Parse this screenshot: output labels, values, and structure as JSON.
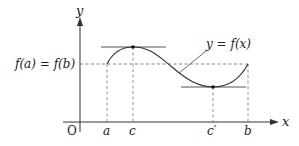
{
  "diagram": {
    "type": "rolle-theorem-graph",
    "axes": {
      "x_label": "x",
      "y_label": "y",
      "origin_label": "O"
    },
    "level_label": "f(a) = f(b)",
    "curve_label": "y = f(x)",
    "x_ticks": [
      {
        "id": "a",
        "label": "a"
      },
      {
        "id": "c",
        "label": "c"
      },
      {
        "id": "c_prime",
        "label": "c′"
      },
      {
        "id": "b",
        "label": "b"
      }
    ],
    "colors": {
      "axis": "#333333",
      "curve": "#333333",
      "tangent": "#555555",
      "dashed": "#666666",
      "text": "#222222"
    }
  }
}
